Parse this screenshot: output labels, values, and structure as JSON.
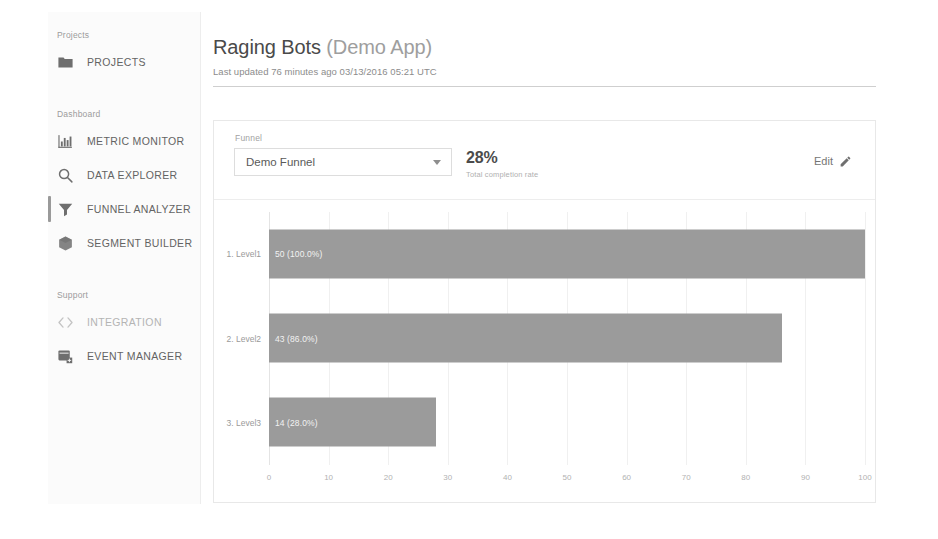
{
  "sidebar": {
    "sections": [
      {
        "label": "Projects",
        "items": [
          {
            "label": "PROJECTS",
            "icon": "folder-icon",
            "name": "projects",
            "active": false,
            "dim": false
          }
        ]
      },
      {
        "label": "Dashboard",
        "items": [
          {
            "label": "METRIC MONITOR",
            "icon": "bar-chart-icon",
            "name": "metric-monitor",
            "active": false,
            "dim": false
          },
          {
            "label": "DATA EXPLORER",
            "icon": "search-icon",
            "name": "data-explorer",
            "active": false,
            "dim": false
          },
          {
            "label": "FUNNEL ANALYZER",
            "icon": "funnel-icon",
            "name": "funnel-analyzer",
            "active": true,
            "dim": false
          },
          {
            "label": "SEGMENT BUILDER",
            "icon": "cube-icon",
            "name": "segment-builder",
            "active": false,
            "dim": false
          }
        ]
      },
      {
        "label": "Support",
        "items": [
          {
            "label": "INTEGRATION",
            "icon": "code-brackets-icon",
            "name": "integration",
            "active": false,
            "dim": true
          },
          {
            "label": "EVENT MANAGER",
            "icon": "event-manager-icon",
            "name": "event-manager",
            "active": false,
            "dim": false
          }
        ]
      }
    ]
  },
  "header": {
    "title_main": "Raging Bots ",
    "title_subtle": "(Demo App)",
    "subtitle": "Last updated 76 minutes ago 03/13/2016 05:21 UTC"
  },
  "card": {
    "funnel_field_label": "Funnel",
    "funnel_selected": "Demo Funnel",
    "funnel_options": [
      "Demo Funnel"
    ],
    "completion_value": "28%",
    "completion_caption": "Total completion rate",
    "edit_label": "Edit"
  },
  "colors": {
    "bar": "#9b9b9b",
    "accent_active": "#9a9a9a",
    "text_muted": "#9a9a9a"
  },
  "chart_data": {
    "type": "bar",
    "orientation": "horizontal",
    "title": "",
    "xlabel": "",
    "ylabel": "",
    "xlim": [
      0,
      100
    ],
    "grid": true,
    "legend": false,
    "categories": [
      "1. Level1",
      "2. Level2",
      "3. Level3"
    ],
    "values": [
      100.0,
      86.0,
      28.0
    ],
    "counts": [
      50,
      43,
      14
    ],
    "bar_labels": [
      "50 (100.0%)",
      "43 (86.0%)",
      "14 (28.0%)"
    ],
    "xticks": [
      0,
      10,
      20,
      30,
      40,
      50,
      60,
      70,
      80,
      90,
      100
    ],
    "xtick_labels": [
      "0",
      "10",
      "20",
      "30",
      "40",
      "50",
      "60",
      "70",
      "80",
      "90",
      "100"
    ]
  }
}
